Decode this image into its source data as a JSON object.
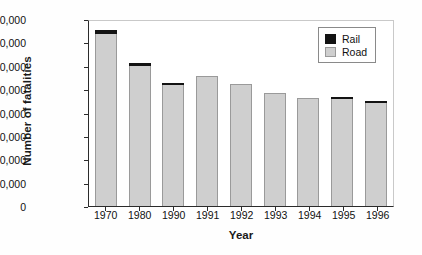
{
  "chart_data": {
    "type": "bar",
    "stacked": true,
    "title": "",
    "xlabel": "Year",
    "ylabel": "Number of fatalities",
    "categories": [
      "1970",
      "1980",
      "1990",
      "1991",
      "1992",
      "1993",
      "1994",
      "1995",
      "1996"
    ],
    "ylim": [
      0,
      80000
    ],
    "yticks": [
      0,
      10000,
      20000,
      30000,
      40000,
      50000,
      60000,
      70000,
      80000
    ],
    "ytick_labels": [
      "0",
      "10,000",
      "20,000",
      "30,000",
      "40,000",
      "50,000",
      "60,000",
      "70,000",
      "80,000"
    ],
    "grid": false,
    "legend_position": "top-right",
    "series": [
      {
        "name": "Road",
        "color": "#cfcfcf",
        "values": [
          73500,
          60000,
          51600,
          55800,
          52300,
          48400,
          46200,
          45600,
          44000
        ]
      },
      {
        "name": "Rail",
        "color": "#131313",
        "values": [
          2000,
          1000,
          900,
          0,
          0,
          0,
          0,
          900,
          600
        ]
      }
    ],
    "totals": [
      75500,
      61000,
      52500,
      55800,
      52300,
      48400,
      46200,
      46500,
      44600
    ]
  },
  "legend": {
    "entries": [
      {
        "label": "Rail",
        "swatch": "sw-rail"
      },
      {
        "label": "Road",
        "swatch": "sw-road"
      }
    ]
  }
}
